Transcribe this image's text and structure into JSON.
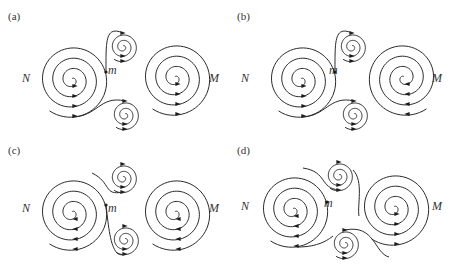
{
  "figure": {
    "panels": [
      {
        "id": "a",
        "label": "(a)",
        "offset": [
          0,
          0
        ],
        "labels": {
          "N": "N",
          "M": "M",
          "m": "m"
        },
        "N": {
          "cx": 72,
          "cy": 80,
          "dir": 1,
          "arrows": "down-right"
        },
        "M": {
          "cx": 175,
          "cy": 78,
          "dir": 1,
          "arrows": "down-right"
        },
        "small_top": {
          "cx": 123,
          "cy": 47
        },
        "small_bottom": {
          "cx": 125,
          "cy": 115
        },
        "separatrix_style": "a"
      },
      {
        "id": "b",
        "label": "(b)",
        "offset": [
          229,
          0
        ],
        "labels": {
          "N": "N",
          "M": "M",
          "m": "m"
        },
        "N": {
          "cx": 72,
          "cy": 80,
          "dir": 1,
          "arrows": "down-right"
        },
        "M": {
          "cx": 175,
          "cy": 78,
          "dir": -1,
          "arrows": "up-left"
        },
        "small_top": {
          "cx": 123,
          "cy": 47
        },
        "small_bottom": {
          "cx": 125,
          "cy": 115
        },
        "separatrix_style": "a"
      },
      {
        "id": "c",
        "label": "(c)",
        "offset": [
          0,
          134
        ],
        "labels": {
          "N": "N",
          "M": "M",
          "m": "m"
        },
        "N": {
          "cx": 72,
          "cy": 79,
          "dir": -1,
          "arrows": "left"
        },
        "M": {
          "cx": 175,
          "cy": 79,
          "dir": -1,
          "arrows": "left"
        },
        "small_top": {
          "cx": 123,
          "cy": 44
        },
        "small_bottom": {
          "cx": 125,
          "cy": 106
        },
        "separatrix_style": "c"
      },
      {
        "id": "d",
        "label": "(d)",
        "offset": [
          229,
          134
        ],
        "labels": {
          "N": "N",
          "M": "M",
          "m": "m"
        },
        "N": {
          "cx": 64,
          "cy": 76,
          "dir": -1,
          "arrows": "left"
        },
        "M": {
          "cx": 165,
          "cy": 74,
          "dir": 1,
          "arrows": "right"
        },
        "small_top": {
          "cx": 110,
          "cy": 42
        },
        "small_bottom": {
          "cx": 116,
          "cy": 110
        },
        "separatrix_style": "d"
      }
    ]
  }
}
